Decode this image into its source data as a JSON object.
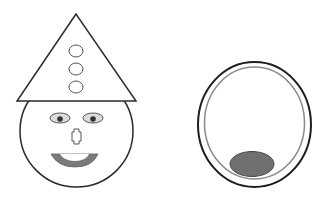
{
  "canvas": {
    "width": 325,
    "height": 197,
    "background": "#ffffff"
  },
  "colors": {
    "stroke": "#2a2a2a",
    "light_fill": "#dcdcdc",
    "inner_ring": "#8a8a8a",
    "mouth": "#7a7a7a",
    "dark_ellipse": "#707070",
    "pupil": "#333333"
  },
  "figures": [
    {
      "name": "clown-face",
      "parts": [
        "hat",
        "hat-buttons",
        "head",
        "eyes",
        "nose",
        "mouth"
      ],
      "hat_buttons_count": 3
    },
    {
      "name": "ring-with-ellipse",
      "parts": [
        "outer-ring",
        "inner-ring",
        "dark-ellipse"
      ]
    }
  ]
}
